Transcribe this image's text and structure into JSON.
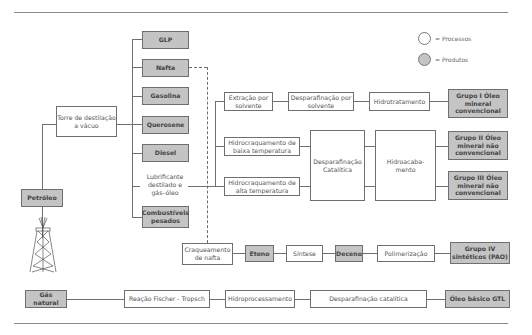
{
  "legend": {
    "process_label": "= Processos",
    "product_label": "= Produtos"
  },
  "products": {
    "petroleo": "Petróleo",
    "glp": "GLP",
    "nafta": "Nafta",
    "gasolina": "Gasolina",
    "querosene": "Querosene",
    "diesel": "Diesel",
    "combustiveis": "Combustíveis pesados",
    "eteno": "Eteno",
    "deceno": "Deceno",
    "gas_natural": "Gás natural",
    "grupo1": "Grupo I Óleo mineral convencional",
    "grupo2": "Grupo II Óleo mineral não convencional",
    "grupo3": "Grupo III Óleo mineral não convencional",
    "grupo4": "Grupo IV sintéticos (PAO)",
    "gtl": "Óleo básico GTL"
  },
  "processes": {
    "torre": "Torre de destilação a vácuo",
    "lubrificante": "Lubrificante destilado e gás–óleo",
    "extracao": "Extração por solvente",
    "desp_solvente": "Desparafinação por solvente",
    "hidrotratamento": "Hidrotratamento",
    "hidro_baixa": "Hidrocraquamento de baixa temperatura",
    "hidro_alta": "Hidrocraquamento de alta temperatura",
    "desp_catalitica": "Desparafinação Catalítica",
    "hidroacabamento": "Hidroacaba- mento",
    "craqueamento": "Craqueamento de nafta",
    "sintese": "Síntese",
    "polimerizacao": "Polimerização",
    "fischer": "Reação Fischer - Tropsch",
    "hidroprocessamento": "Hidroprocessamento",
    "desp_catalitica_gtl": "Desparafinação catalítica"
  },
  "colors": {
    "product_fill": "#c4c4c4",
    "process_fill": "#ffffff",
    "line": "#6f6f6f"
  }
}
